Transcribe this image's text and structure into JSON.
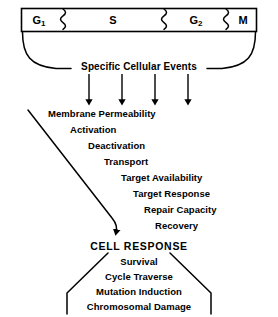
{
  "diagram": {
    "colors": {
      "ink": "#000000",
      "background": "#ffffff"
    },
    "cell_cycle_bar": {
      "phases": [
        {
          "label": "G",
          "subscript": "1",
          "x": 39,
          "y": 20
        },
        {
          "label": "S",
          "subscript": "",
          "x": 113,
          "y": 20
        },
        {
          "label": "G",
          "subscript": "2",
          "x": 196,
          "y": 20
        },
        {
          "label": "M",
          "subscript": "",
          "x": 243,
          "y": 20
        }
      ],
      "separators": [
        {
          "name": "squiggle-g1-s",
          "x": 63
        },
        {
          "name": "squiggle-s-g2",
          "x": 164
        },
        {
          "name": "squiggle-g2-m",
          "x": 226
        }
      ]
    },
    "events_heading": {
      "label": "Specific Cellular Events",
      "x": 139,
      "y": 67
    },
    "event_arrows": [
      {
        "name": "event-arrow-1",
        "x": 89
      },
      {
        "name": "event-arrow-2",
        "x": 122
      },
      {
        "name": "event-arrow-3",
        "x": 155
      },
      {
        "name": "event-arrow-4",
        "x": 188
      }
    ],
    "event_list": [
      {
        "label": "Membrane Permeability",
        "x": 48,
        "y": 114
      },
      {
        "label": "Activation",
        "x": 70,
        "y": 130
      },
      {
        "label": "Deactivation",
        "x": 88,
        "y": 146
      },
      {
        "label": "Transport",
        "x": 104,
        "y": 162
      },
      {
        "label": "Target Availability",
        "x": 121,
        "y": 178
      },
      {
        "label": "Target Response",
        "x": 133,
        "y": 194
      },
      {
        "label": "Repair Capacity",
        "x": 144,
        "y": 210
      },
      {
        "label": "Recovery",
        "x": 155,
        "y": 226
      }
    ],
    "response": {
      "heading": "CELL RESPONSE",
      "heading_x": 139,
      "heading_y": 246,
      "items": [
        {
          "label": "Survival",
          "x": 139,
          "y": 262
        },
        {
          "label": "Cycle Traverse",
          "x": 139,
          "y": 277
        },
        {
          "label": "Mutation Induction",
          "x": 139,
          "y": 292
        },
        {
          "label": "Chromosomal Damage",
          "x": 139,
          "y": 307
        }
      ]
    }
  }
}
